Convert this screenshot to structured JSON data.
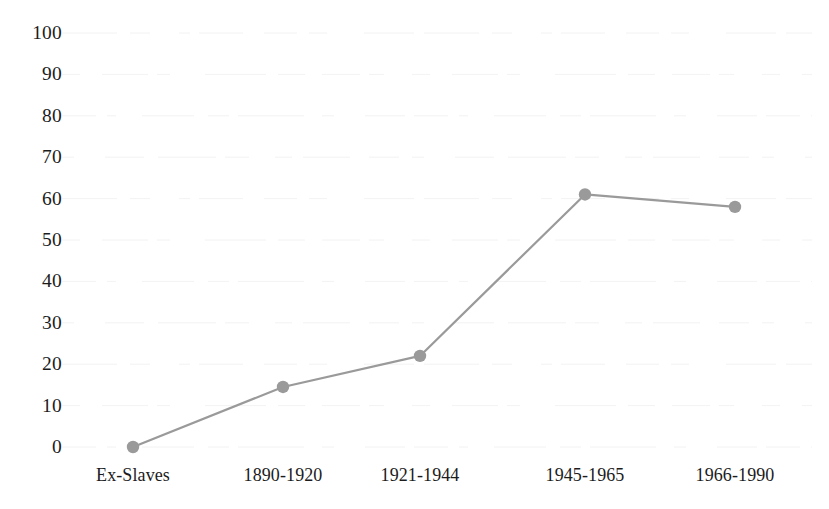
{
  "chart_data": {
    "type": "line",
    "title": "",
    "subtitle": "",
    "xlabel": "",
    "ylabel": "",
    "categories": [
      "Ex-Slaves",
      "1890-1920",
      "1921-1944",
      "1945-1965",
      "1966-1990"
    ],
    "values": [
      0,
      14.5,
      22,
      61,
      58
    ],
    "ylim": [
      0,
      100
    ],
    "y_ticks": [
      0,
      10,
      20,
      30,
      40,
      50,
      60,
      70,
      80,
      90,
      100
    ],
    "y_tick_labels": [
      "0",
      "10",
      "20",
      "30",
      "40",
      "50",
      "60",
      "70",
      "80",
      "90",
      "100"
    ],
    "grid": true,
    "legend": false,
    "series": [
      {
        "name": "",
        "values": [
          0,
          14.5,
          22,
          61,
          58
        ]
      }
    ],
    "marker": "circle",
    "colors": {
      "line": "#9a9a9a",
      "marker": "#9a9a9a",
      "text": "#1c1c1c",
      "grid": "#f2f2f2",
      "background": "#ffffff"
    }
  }
}
